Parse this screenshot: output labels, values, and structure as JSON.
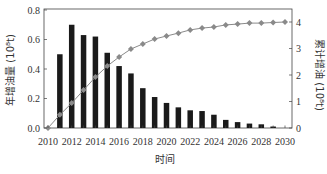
{
  "chart_data": {
    "type": "bar+line",
    "title": "",
    "xlabel": "时间",
    "ylabel_left": "年增油量 (10⁸t)",
    "ylabel_right": "累计增油 (10⁸t)",
    "x_ticks": [
      "2010",
      "2012",
      "2014",
      "2016",
      "2018",
      "2020",
      "2022",
      "2024",
      "2026",
      "2028",
      "2030"
    ],
    "y_left_ticks": [
      "0.0",
      "0.2",
      "0.4",
      "0.6",
      "0.8"
    ],
    "y_right_ticks": [
      "0",
      "1",
      "2",
      "3",
      "4"
    ],
    "ylim_left": [
      0,
      0.8
    ],
    "ylim_right": [
      0,
      4
    ],
    "xlim": [
      2010,
      2030
    ],
    "grid": false,
    "legend": null,
    "series": [
      {
        "name": "年增油量",
        "type": "bar",
        "axis": "left",
        "color": "#1a1a1a",
        "x": [
          2011,
          2012,
          2013,
          2014,
          2015,
          2016,
          2017,
          2018,
          2019,
          2020,
          2021,
          2022,
          2023,
          2024,
          2025,
          2026,
          2027,
          2028,
          2029
        ],
        "values": [
          0.5,
          0.7,
          0.63,
          0.62,
          0.51,
          0.42,
          0.37,
          0.27,
          0.21,
          0.17,
          0.14,
          0.12,
          0.115,
          0.09,
          0.055,
          0.04,
          0.03,
          0.025,
          0.01
        ]
      },
      {
        "name": "累计增油",
        "type": "line",
        "axis": "right",
        "color": "#8a8a8a",
        "marker": "diamond",
        "x": [
          2010,
          2011,
          2012,
          2013,
          2014,
          2015,
          2016,
          2017,
          2018,
          2019,
          2020,
          2021,
          2022,
          2023,
          2024,
          2025,
          2026,
          2027,
          2028,
          2029,
          2030
        ],
        "values": [
          0.0,
          0.5,
          0.94,
          1.43,
          1.92,
          2.34,
          2.68,
          2.98,
          3.17,
          3.36,
          3.47,
          3.58,
          3.7,
          3.77,
          3.81,
          3.89,
          3.92,
          3.96,
          3.96,
          3.98,
          4.0
        ]
      }
    ]
  }
}
